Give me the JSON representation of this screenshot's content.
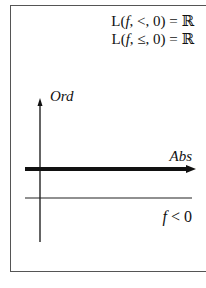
{
  "equations": [
    {
      "prefix": "L(",
      "f": "f",
      "mid": ", <, 0) = ",
      "set": "ℝ"
    },
    {
      "prefix": "L(",
      "f": "f",
      "mid": ", ≤, 0) = ",
      "set": "ℝ"
    }
  ],
  "axes": {
    "ordinate_label": "Ord",
    "abscissa_label": "Abs"
  },
  "condition": {
    "f": "f",
    "rest": " < 0"
  },
  "colors": {
    "stroke": "#111111",
    "frame": "#555555"
  }
}
